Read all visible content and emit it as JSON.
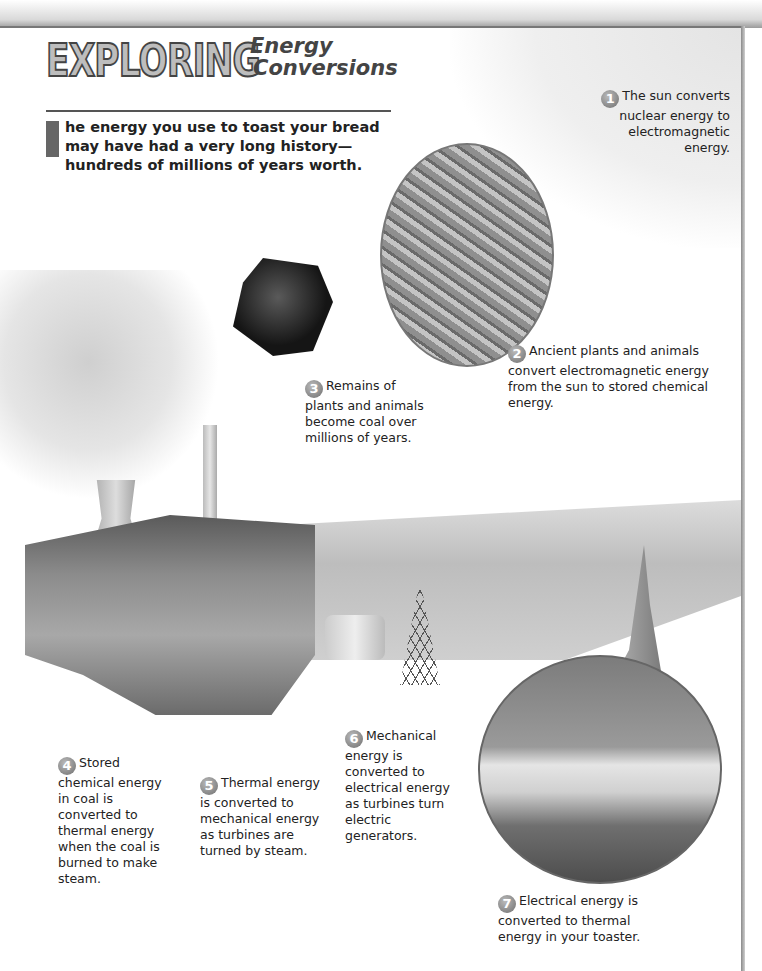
{
  "header": {
    "title_main": "EXPLORING",
    "title_sub_line1": "Energy",
    "title_sub_line2": "Conversions"
  },
  "intro": {
    "drop_cap": "T",
    "text": "he energy you use to toast your bread may have had a very long history—hundreds of millions of years worth."
  },
  "callouts": [
    {
      "number": "1",
      "text": "The sun converts nuclear energy to electromagnetic energy."
    },
    {
      "number": "2",
      "text": "Ancient plants and animals convert electromagnetic energy from the sun to stored chemical energy."
    },
    {
      "number": "3",
      "text": "Remains of plants and animals become coal over millions of years."
    },
    {
      "number": "4",
      "text": "Stored chemical energy in coal is converted to thermal energy when the coal is burned to make steam."
    },
    {
      "number": "5",
      "text": "Thermal energy is converted to mechanical energy as turbines are turned by steam."
    },
    {
      "number": "6",
      "text": "Mechanical energy is converted to electrical energy as turbines turn electric generators."
    },
    {
      "number": "7",
      "text": "Electrical energy is converted to thermal energy in your toaster."
    }
  ],
  "illustrations": [
    {
      "name": "dragonfly-fern-oval"
    },
    {
      "name": "coal-lump"
    },
    {
      "name": "power-plant-cutaway"
    },
    {
      "name": "power-lines-landscape"
    },
    {
      "name": "kitchen-toaster-circle"
    }
  ]
}
